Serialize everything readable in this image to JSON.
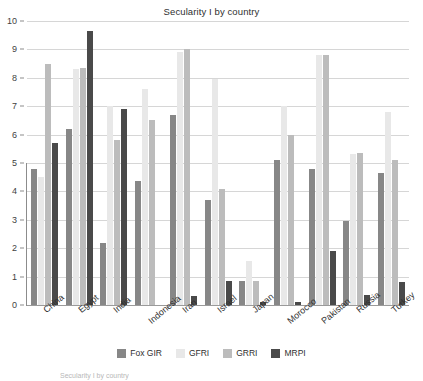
{
  "chart_data": {
    "type": "bar",
    "title": "Secularity I by country",
    "xlabel": "",
    "ylabel": "",
    "ylim": [
      0,
      10
    ],
    "yticks": [
      0,
      1,
      2,
      3,
      4,
      5,
      6,
      7,
      8,
      9,
      10
    ],
    "grid": true,
    "legend_position": "bottom",
    "categories": [
      "China",
      "Egypt",
      "India",
      "Indonesia",
      "Iran",
      "Israel",
      "Japan",
      "Morocco",
      "Pakistan",
      "Russia",
      "Turkey"
    ],
    "series": [
      {
        "name": "Fox GIR",
        "color": "#878787",
        "values": [
          4.8,
          6.2,
          2.2,
          4.35,
          6.7,
          3.7,
          0.85,
          5.1,
          4.8,
          2.95,
          4.65
        ]
      },
      {
        "name": "GFRI",
        "color": "#e8e8e8",
        "values": [
          4.5,
          8.3,
          7.0,
          7.6,
          8.9,
          7.95,
          1.55,
          7.0,
          8.8,
          5.3,
          6.8
        ]
      },
      {
        "name": "GRRI",
        "color": "#bcbcbc",
        "values": [
          8.5,
          8.35,
          5.8,
          6.5,
          9.0,
          4.1,
          0.85,
          6.0,
          8.8,
          5.35,
          5.1
        ]
      },
      {
        "name": "MRPI",
        "color": "#4a4a4a",
        "values": [
          5.7,
          9.65,
          6.9,
          0,
          0.3,
          0.85,
          0.1,
          0.1,
          1.9,
          0.35,
          0.8
        ]
      }
    ]
  },
  "footnote": {
    "text": "Secularity I by country"
  }
}
